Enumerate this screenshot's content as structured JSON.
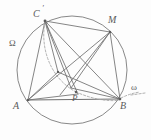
{
  "figure": {
    "background_color": "#fdfdfd",
    "stroke_color": "#6b6b6b",
    "label_color": "#5b5b5b",
    "dashed_stroke_color": "#9a9a9a",
    "labels": {
      "c_prime": "C",
      "c_prime_mark": "′",
      "m": "M",
      "omega_capital": "Ω",
      "omega_small": "ω",
      "a": "A",
      "b": "B",
      "p": "P"
    },
    "points": [
      {
        "name": "A",
        "label": "A",
        "x": 28,
        "y": 100
      },
      {
        "name": "B",
        "label": "B",
        "x": 120,
        "y": 99
      },
      {
        "name": "C-prime",
        "label": "C′",
        "x": 45,
        "y": 21
      },
      {
        "name": "M",
        "label": "M",
        "x": 110,
        "y": 32
      },
      {
        "name": "P",
        "label": "P",
        "x": 78,
        "y": 94
      },
      {
        "name": "I",
        "label": "",
        "x": 58,
        "y": 72
      },
      {
        "name": "Q",
        "label": "",
        "x": 71,
        "y": 88
      }
    ],
    "circle": {
      "name": "circumcircle",
      "cx": 72,
      "cy": 70,
      "r": 55
    },
    "segments": [
      {
        "name": "A-B",
        "from": "A",
        "to": "B"
      },
      {
        "name": "A-Cprime",
        "from": "A",
        "to": "C-prime"
      },
      {
        "name": "B-Cprime",
        "from": "B",
        "to": "C-prime"
      },
      {
        "name": "A-M",
        "from": "A",
        "to": "M"
      },
      {
        "name": "B-M",
        "from": "B",
        "to": "M"
      },
      {
        "name": "Cprime-M",
        "from": "C-prime",
        "to": "M"
      },
      {
        "name": "Cprime-P",
        "from": "C-prime",
        "to": "P"
      },
      {
        "name": "Cprime-I",
        "from": "C-prime",
        "to": "I"
      },
      {
        "name": "A-P",
        "from": "A",
        "to": "P"
      },
      {
        "name": "A-I",
        "from": "A",
        "to": "I"
      },
      {
        "name": "I-B",
        "from": "I",
        "to": "B"
      },
      {
        "name": "M-P",
        "from": "M",
        "to": "P"
      },
      {
        "name": "P-B",
        "from": "P",
        "to": "B"
      }
    ],
    "dashed_elements": [
      {
        "name": "arc-Cprime-to-P",
        "kind": "arc"
      },
      {
        "name": "arc-P-to-omega",
        "kind": "arc"
      },
      {
        "name": "tick-omega",
        "kind": "segment"
      }
    ]
  }
}
